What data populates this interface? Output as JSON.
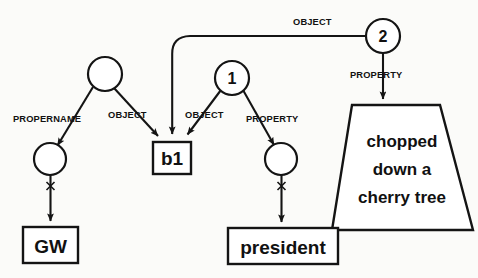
{
  "diagram": {
    "background_color": "#fbfbf9",
    "ink_color": "#141414",
    "nodes": {
      "root_circle": {
        "label": "",
        "type": "circle",
        "cx": 105,
        "cy": 74,
        "r": 17
      },
      "node_one": {
        "label": "1",
        "type": "circle",
        "cx": 232,
        "cy": 78,
        "r": 17
      },
      "node_two": {
        "label": "2",
        "type": "circle",
        "cx": 383,
        "cy": 36,
        "r": 17
      },
      "propername_circle": {
        "label": "",
        "type": "circle",
        "cx": 50,
        "cy": 159,
        "r": 16
      },
      "property_circle": {
        "label": "",
        "type": "circle",
        "cx": 281,
        "cy": 159,
        "r": 16
      },
      "b1_box": {
        "label": "b1",
        "type": "rect",
        "x": 153,
        "y": 142,
        "w": 38,
        "h": 32
      },
      "gw_box": {
        "label": "GW",
        "type": "rect",
        "x": 23,
        "y": 227,
        "w": 55,
        "h": 36
      },
      "president_box": {
        "label": "president",
        "type": "rect",
        "x": 228,
        "y": 228,
        "w": 110,
        "h": 36
      },
      "event_trapezoid": {
        "type": "trapezoid",
        "lines": [
          "chopped",
          "down a",
          "cherry tree"
        ]
      }
    },
    "edge_labels": {
      "propername": "PROPERNAME",
      "object_left": "OBJECT",
      "object_mid": "OBJECT",
      "object_top": "OBJECT",
      "property_left": "PROPERTY",
      "property_right": "PROPERTY"
    }
  }
}
